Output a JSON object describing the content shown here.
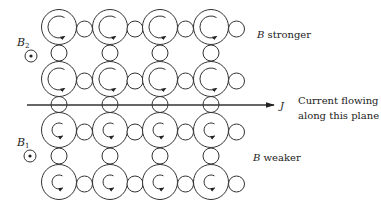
{
  "diagram": {
    "grid": {
      "columns_x": [
        59,
        110,
        160,
        211
      ],
      "rows_y": [
        27,
        79,
        130,
        182
      ],
      "big_radius": 17.5,
      "small_radius": 8,
      "upper_curl_radius": 11,
      "lower_curl_radius": 7
    },
    "labels": {
      "b2_symbol": "B",
      "b2_subscript": "2",
      "b1_symbol": "B",
      "b1_subscript": "1",
      "b_stronger_symbol": "B",
      "b_stronger_text": " stronger",
      "b_weaker_symbol": "B",
      "b_weaker_text": " weaker",
      "current_symbol": "J",
      "current_line1": "Current flowing",
      "current_line2": "along this plane"
    },
    "icons": {
      "b2_field": "field-out-of-page-icon",
      "b1_field": "field-out-of-page-icon",
      "current_arrow": "arrow-right-icon",
      "vortex_curl": "counterclockwise-arrow-icon"
    },
    "colors": {
      "stroke": "#333333",
      "text": "#222222"
    }
  }
}
